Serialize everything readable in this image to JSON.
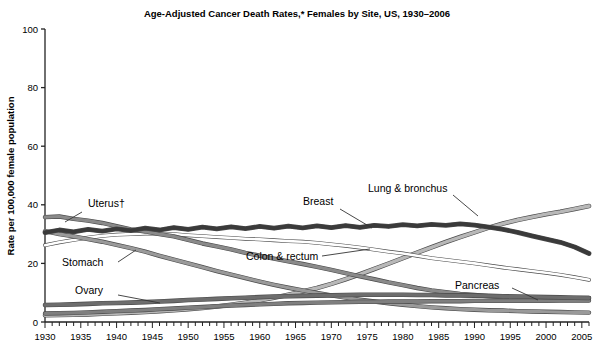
{
  "chart_data": {
    "type": "line",
    "title": "Age-Adjusted Cancer Death Rates,* Females by Site, US, 1930–2006",
    "xlabel": "",
    "ylabel": "Rate per 100,000 female population",
    "xlim": [
      1930,
      2006
    ],
    "ylim": [
      0,
      100
    ],
    "ytick_values": [
      0,
      20,
      40,
      60,
      80,
      100
    ],
    "ytick_labels": [
      "0",
      "20",
      "40",
      "60",
      "80",
      "100"
    ],
    "xtick_labels": [
      "1930",
      "1935",
      "1940",
      "1945",
      "1950",
      "1955",
      "1960",
      "1965",
      "1970",
      "1975",
      "1980",
      "1985",
      "1990",
      "1995",
      "2000",
      "2005"
    ],
    "xtick_values": [
      1930,
      1935,
      1940,
      1945,
      1950,
      1955,
      1960,
      1965,
      1970,
      1975,
      1980,
      1985,
      1990,
      1995,
      2000,
      2005
    ],
    "minor_xtick_step": 1,
    "grid": false,
    "legend": "inline-annotations",
    "x": [
      1930,
      1932,
      1934,
      1936,
      1938,
      1940,
      1942,
      1944,
      1946,
      1948,
      1950,
      1952,
      1954,
      1956,
      1958,
      1960,
      1962,
      1964,
      1966,
      1968,
      1970,
      1972,
      1974,
      1976,
      1978,
      1980,
      1982,
      1984,
      1986,
      1988,
      1990,
      1992,
      1994,
      1996,
      1998,
      2000,
      2002,
      2004,
      2006
    ],
    "series": [
      {
        "name": "Uterus†",
        "label": "Uterus†",
        "color": "#8a8a8a",
        "width": 3.2,
        "values": [
          35.8,
          36.0,
          35.2,
          34.6,
          33.8,
          32.7,
          31.6,
          30.9,
          30.0,
          29.2,
          28.0,
          26.8,
          25.8,
          24.8,
          23.6,
          22.6,
          21.6,
          20.7,
          19.8,
          18.8,
          17.8,
          16.7,
          15.6,
          14.6,
          13.5,
          12.6,
          11.6,
          10.8,
          10.2,
          9.6,
          9.2,
          8.8,
          8.5,
          8.3,
          8.2,
          8.1,
          8.1,
          8.2,
          8.2
        ]
      },
      {
        "name": "Stomach",
        "label": "Stomach",
        "color": "#9a9a9a",
        "width": 3.2,
        "values": [
          31.0,
          30.0,
          29.2,
          28.3,
          27.4,
          26.3,
          25.2,
          24.0,
          22.6,
          21.3,
          20.0,
          18.7,
          17.4,
          16.2,
          15.0,
          13.8,
          12.7,
          11.7,
          10.8,
          9.9,
          9.1,
          8.3,
          7.6,
          7.0,
          6.4,
          5.9,
          5.4,
          5.0,
          4.7,
          4.4,
          4.2,
          4.0,
          3.9,
          3.7,
          3.6,
          3.5,
          3.4,
          3.3,
          3.2
        ]
      },
      {
        "name": "Breast",
        "label": "Breast",
        "color": "#3a3a3a",
        "width": 3.6,
        "values": [
          30.5,
          31.4,
          30.8,
          31.6,
          31.0,
          31.8,
          31.2,
          32.0,
          31.4,
          32.2,
          31.6,
          32.4,
          31.8,
          32.5,
          31.9,
          32.6,
          32.0,
          32.7,
          32.1,
          32.8,
          32.2,
          32.9,
          32.3,
          33.0,
          32.6,
          33.2,
          32.8,
          33.3,
          33.0,
          33.5,
          33.1,
          32.4,
          31.6,
          30.6,
          29.4,
          28.3,
          27.2,
          25.6,
          23.4
        ]
      },
      {
        "name": "Colon & rectum",
        "label": "Colon & rectum",
        "color": "#ffffff",
        "width": 2.6,
        "values": [
          26.2,
          27.2,
          28.0,
          28.8,
          29.4,
          29.8,
          30.0,
          30.2,
          30.2,
          30.0,
          29.6,
          29.3,
          29.0,
          28.7,
          28.4,
          28.2,
          27.9,
          27.6,
          27.4,
          27.0,
          26.5,
          26.0,
          25.4,
          24.7,
          24.0,
          23.4,
          22.6,
          21.8,
          21.2,
          20.6,
          20.0,
          19.3,
          18.6,
          18.0,
          17.4,
          16.8,
          16.1,
          15.3,
          14.4
        ]
      },
      {
        "name": "Lung & bronchus",
        "label": "Lung & bronchus",
        "color": "#b8b8b8",
        "width": 3.4,
        "values": [
          2.3,
          2.4,
          2.5,
          2.6,
          2.8,
          3.0,
          3.2,
          3.4,
          3.7,
          4.0,
          4.4,
          4.8,
          5.3,
          5.9,
          6.6,
          7.4,
          8.3,
          9.3,
          10.4,
          11.6,
          13.0,
          14.6,
          16.3,
          18.1,
          19.9,
          21.8,
          23.7,
          25.5,
          27.3,
          29.0,
          30.6,
          32.2,
          33.6,
          34.8,
          35.8,
          36.8,
          37.6,
          38.6,
          39.6
        ]
      },
      {
        "name": "Ovary",
        "label": "Ovary",
        "color": "#6d6d6d",
        "width": 3.4,
        "values": [
          5.8,
          5.9,
          6.0,
          6.2,
          6.4,
          6.5,
          6.6,
          6.8,
          7.0,
          7.2,
          7.5,
          7.7,
          7.9,
          8.1,
          8.3,
          8.5,
          8.7,
          8.8,
          8.9,
          9.0,
          9.1,
          9.2,
          9.3,
          9.3,
          9.3,
          9.3,
          9.2,
          9.2,
          9.1,
          9.1,
          9.0,
          8.9,
          8.8,
          8.7,
          8.6,
          8.5,
          8.4,
          8.3,
          8.2
        ]
      },
      {
        "name": "Pancreas",
        "label": "Pancreas",
        "color": "#7f7f7f",
        "width": 3.2,
        "values": [
          2.9,
          3.0,
          3.1,
          3.3,
          3.5,
          3.7,
          3.9,
          4.1,
          4.4,
          4.6,
          4.9,
          5.1,
          5.4,
          5.6,
          5.8,
          6.0,
          6.2,
          6.4,
          6.5,
          6.6,
          6.7,
          6.8,
          6.9,
          6.9,
          7.0,
          7.0,
          7.0,
          7.1,
          7.1,
          7.1,
          7.2,
          7.2,
          7.2,
          7.2,
          7.2,
          7.2,
          7.3,
          7.3,
          7.3
        ]
      }
    ],
    "annotations": [
      {
        "name": "uterus-label",
        "text": "Uterus†"
      },
      {
        "name": "stomach-label",
        "text": "Stomach"
      },
      {
        "name": "ovary-label",
        "text": "Ovary"
      },
      {
        "name": "breast-label",
        "text": "Breast"
      },
      {
        "name": "colon-rectum-label",
        "text": "Colon & rectum"
      },
      {
        "name": "lung-bronchus-label",
        "text": "Lung & bronchus"
      },
      {
        "name": "pancreas-label",
        "text": "Pancreas"
      }
    ]
  }
}
